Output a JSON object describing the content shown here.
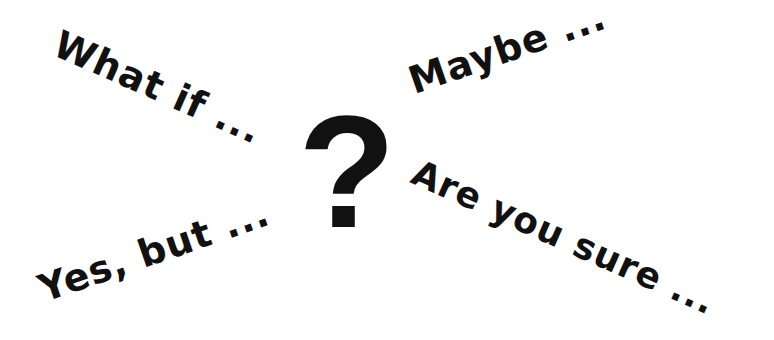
{
  "phrases": {
    "top_left": "What if ...",
    "top_right": "Maybe ...",
    "bottom_right": "Are you sure ...",
    "bottom_left": "Yes, but ..."
  },
  "center_symbol": "?",
  "colors": {
    "text": "#111111",
    "background": "#ffffff"
  }
}
